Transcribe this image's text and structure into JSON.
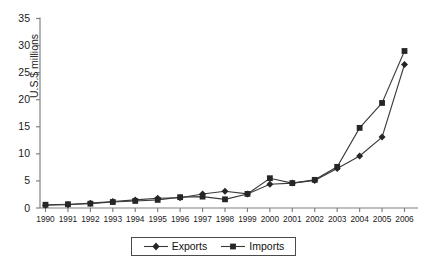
{
  "chart_data": {
    "type": "line",
    "title": "",
    "subtitle": "",
    "xlabel": "",
    "ylabel": "U.S.$ millions",
    "x": [
      1990,
      1991,
      1992,
      1993,
      1994,
      1995,
      1996,
      1997,
      1998,
      1999,
      2000,
      2001,
      2002,
      2003,
      2004,
      2005,
      2006
    ],
    "categories": [
      "1990",
      "1991",
      "1992",
      "1993",
      "1994",
      "1995",
      "1996",
      "1997",
      "1998",
      "1999",
      "2000",
      "2001",
      "2002",
      "2003",
      "2004",
      "2005",
      "2006"
    ],
    "xlim": [
      1990,
      2006
    ],
    "ylim": [
      0,
      35
    ],
    "yticks": [
      0,
      5,
      10,
      15,
      20,
      25,
      30,
      35
    ],
    "ytick_labels": [
      "0",
      "5",
      "10",
      "15",
      "20",
      "25",
      "30",
      "35"
    ],
    "grid": false,
    "legend_position": "bottom-center",
    "series": [
      {
        "name": "Exports",
        "marker": "diamond",
        "color": "#262626",
        "values": [
          0.5,
          0.6,
          0.9,
          1.2,
          1.5,
          1.8,
          1.9,
          2.6,
          3.1,
          2.6,
          4.4,
          4.6,
          5.1,
          7.3,
          9.6,
          13.1,
          26.5
        ]
      },
      {
        "name": "Imports",
        "marker": "square",
        "color": "#262626",
        "values": [
          0.6,
          0.7,
          0.8,
          1.1,
          1.3,
          1.5,
          2.0,
          2.1,
          1.6,
          2.6,
          5.5,
          4.6,
          5.2,
          7.6,
          14.8,
          19.4,
          29.0
        ]
      }
    ]
  },
  "legend": {
    "entries": [
      {
        "label": "Exports"
      },
      {
        "label": "Imports"
      }
    ]
  },
  "axis": {
    "y_title": "U.S.$ millions"
  },
  "colors": {
    "line": "#3a3a3a",
    "marker": "#262626",
    "axis": "#808080",
    "text": "#1a1a1a",
    "legend_border": "#4a4a4a",
    "background": "#ffffff"
  }
}
